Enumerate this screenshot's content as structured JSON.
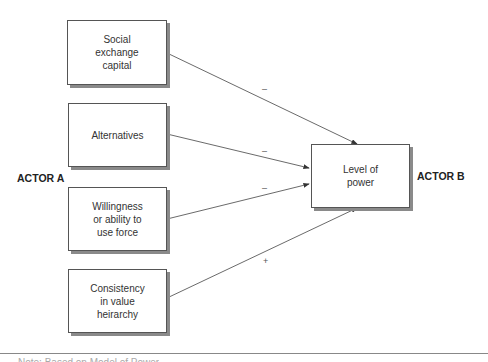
{
  "diagram": {
    "actor_a": "ACTOR A",
    "actor_b": "ACTOR B",
    "sources": [
      {
        "id": "social-exchange-capital",
        "label": "Social\nexchange\ncapital",
        "sign": "–"
      },
      {
        "id": "alternatives",
        "label": "Alternatives",
        "sign": "–"
      },
      {
        "id": "willingness-force",
        "label": "Willingness\nor ability to\nuse force",
        "sign": "–"
      },
      {
        "id": "consistency-value",
        "label": "Consistency\nin value\nheirarchy",
        "sign": "+"
      }
    ],
    "target": {
      "id": "level-of-power",
      "label": "Level of\npower"
    },
    "edges": [
      {
        "from": "social-exchange-capital",
        "to": "level-of-power",
        "sign": "–"
      },
      {
        "from": "alternatives",
        "to": "level-of-power",
        "sign": "–"
      },
      {
        "from": "willingness-force",
        "to": "level-of-power",
        "sign": "–"
      },
      {
        "from": "consistency-value",
        "to": "level-of-power",
        "sign": "+"
      }
    ]
  },
  "caption_partial": "Note: Based on Model of Power"
}
